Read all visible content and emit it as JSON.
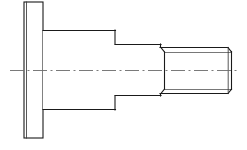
{
  "drawing": {
    "title": "Shoulder screw / flanged stepped shaft — side elevation",
    "type": "engineering-line-drawing",
    "projection": "orthographic side view",
    "background_color": "#ffffff",
    "line_color": "#1a1a1a",
    "secondary_line_color": "#555555",
    "centerline_color": "#6b6b6b",
    "canvas": {
      "width": 247,
      "height": 150
    },
    "axis_y": 70,
    "features": [
      {
        "name": "flange-head",
        "label": "Flange head",
        "shape": "rectangle",
        "x_start": 24,
        "x_end": 43,
        "y_top": 2,
        "y_bottom": 138,
        "height": 136,
        "inner_edge_x": 26
      },
      {
        "name": "main-body",
        "label": "Main cylindrical body",
        "shape": "rectangle",
        "x_start": 43,
        "x_end": 115,
        "y_top": 30,
        "y_bottom": 110,
        "height": 80
      },
      {
        "name": "mid-shaft",
        "label": "Reduced diameter shaft",
        "shape": "rectangle",
        "x_start": 115,
        "x_end": 160,
        "y_top": 44,
        "y_bottom": 96,
        "height": 52
      },
      {
        "name": "threaded-end",
        "label": "Threaded end",
        "shape": "rectangle-with-thread",
        "x_start": 160,
        "x_end": 232,
        "y_top": 47,
        "y_bottom": 94,
        "height": 47,
        "root_y_top": 52,
        "root_y_bottom": 89,
        "chamfer": 4
      }
    ],
    "centerline": {
      "name": "axis-centerline",
      "label": "Axis of revolution",
      "x_start": 10,
      "x_end": 240,
      "y": 70,
      "style": "dash-dot"
    }
  }
}
